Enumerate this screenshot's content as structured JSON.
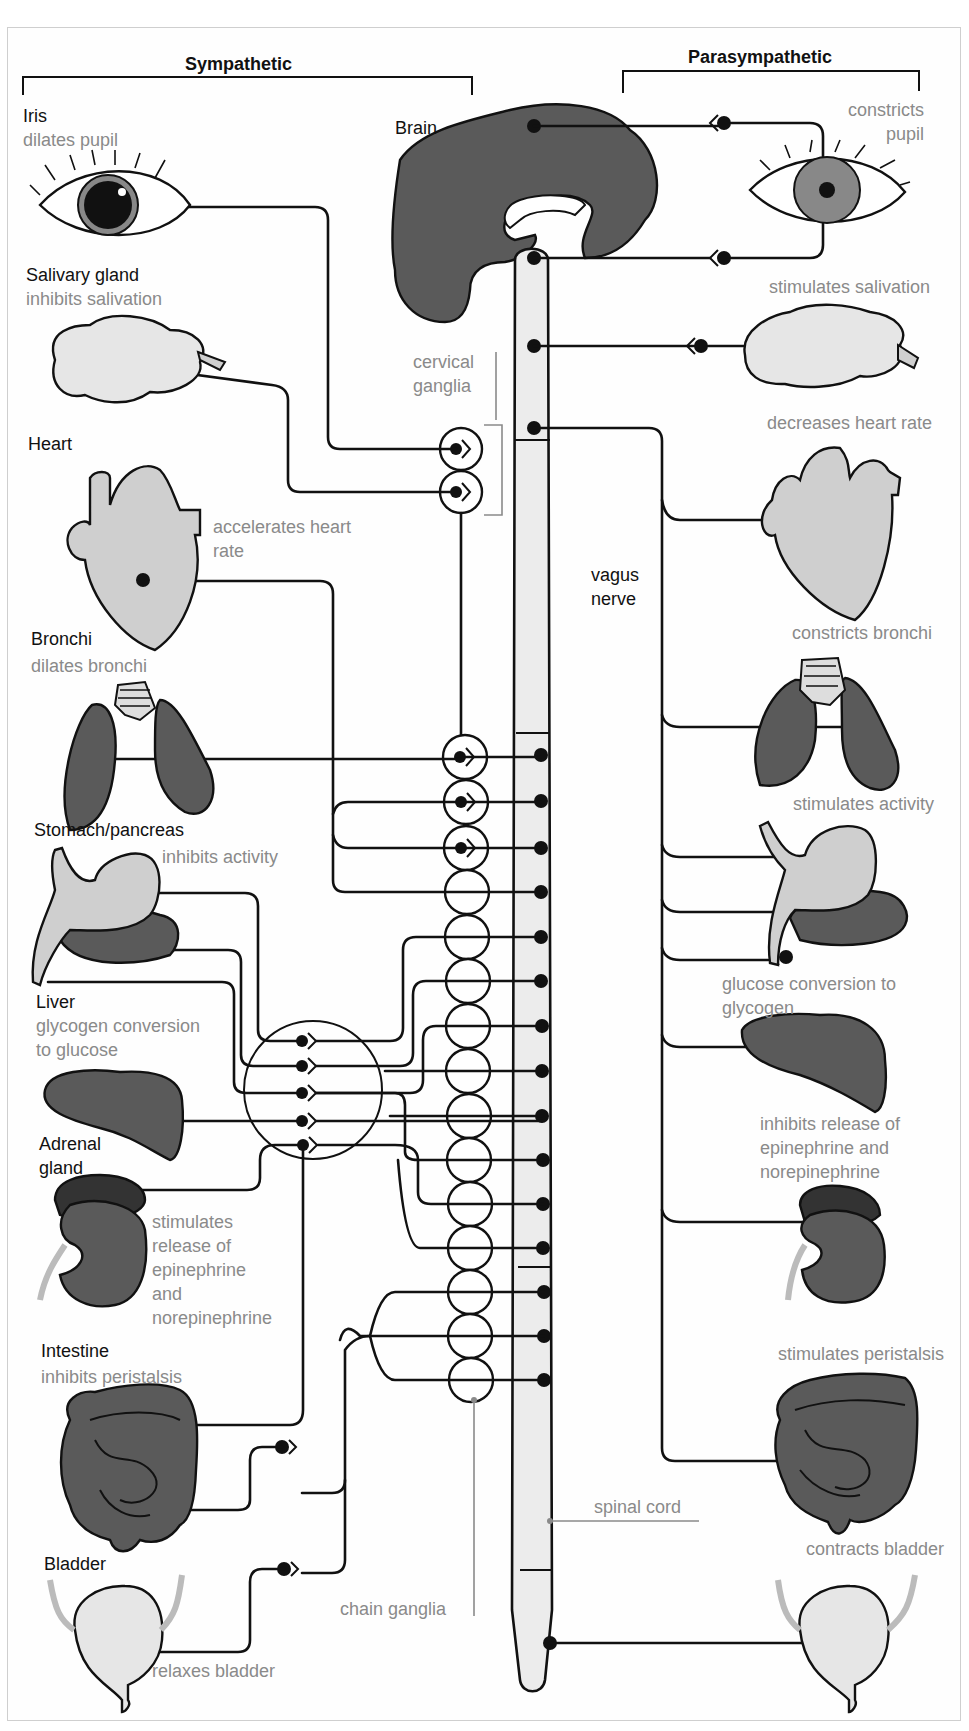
{
  "headers": {
    "sympathetic": "Sympathetic",
    "parasympathetic": "Parasympathetic"
  },
  "center": {
    "brain": "Brain",
    "cervical_ganglia": [
      "cervical",
      "ganglia"
    ],
    "vagus_nerve": [
      "vagus",
      "nerve"
    ],
    "spinal_cord": "spinal cord",
    "chain_ganglia": "chain ganglia"
  },
  "sympathetic": [
    {
      "organ": "Iris",
      "effect": [
        "dilates pupil"
      ]
    },
    {
      "organ": "Salivary gland",
      "effect": [
        "inhibits salivation"
      ]
    },
    {
      "organ": "Heart",
      "effect": [
        "accelerates heart",
        "rate"
      ]
    },
    {
      "organ": "Bronchi",
      "effect": [
        "dilates bronchi"
      ]
    },
    {
      "organ": "Stomach/pancreas",
      "effect": [
        "inhibits activity"
      ]
    },
    {
      "organ": "Liver",
      "effect": [
        "glycogen conversion",
        "to glucose"
      ]
    },
    {
      "organ": "Adrenal gland",
      "organ_lines": [
        "Adrenal",
        "gland"
      ],
      "effect": [
        "stimulates",
        "release of",
        "epinephrine",
        "and",
        "norepinephrine"
      ]
    },
    {
      "organ": "Intestine",
      "effect": [
        "inhibits peristalsis"
      ]
    },
    {
      "organ": "Bladder",
      "effect": [
        "relaxes bladder"
      ]
    }
  ],
  "parasympathetic": [
    {
      "organ": "Iris",
      "effect": [
        "constricts",
        "pupil"
      ]
    },
    {
      "organ": "Salivary gland",
      "effect": [
        "stimulates salivation"
      ]
    },
    {
      "organ": "Heart",
      "effect": [
        "decreases heart rate"
      ]
    },
    {
      "organ": "Bronchi",
      "effect": [
        "constricts bronchi"
      ]
    },
    {
      "organ": "Stomach/pancreas",
      "effect": [
        "stimulates activity"
      ]
    },
    {
      "organ": "Liver",
      "effect": [
        "glucose conversion to",
        "glycogen"
      ]
    },
    {
      "organ": "Adrenal gland",
      "effect": [
        "inhibits release of",
        "epinephrine and",
        "norepinephrine"
      ]
    },
    {
      "organ": "Intestine",
      "effect": [
        "stimulates peristalsis"
      ]
    },
    {
      "organ": "Bladder",
      "effect": [
        "contracts bladder"
      ]
    }
  ],
  "colors": {
    "line": "#111111",
    "label_gray": "#8a8a8a",
    "organ_dark": "#5a5a5a",
    "organ_light": "#cfcfcf",
    "cord_fill": "#ececec"
  }
}
